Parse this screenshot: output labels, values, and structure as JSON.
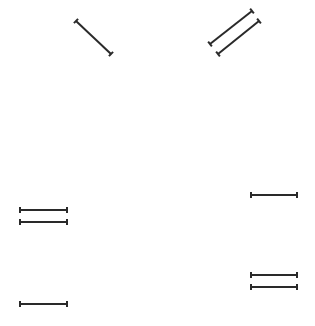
{
  "canvas": {
    "width": 315,
    "height": 326,
    "background": "#ffffff"
  },
  "style": {
    "stroke": "#2a2a2a",
    "stroke_width": 2,
    "cap_length": 6
  },
  "segments": [
    {
      "id": "diag-1",
      "x1": 76,
      "y1": 21,
      "x2": 111,
      "y2": 54
    },
    {
      "id": "diag-2",
      "x1": 210,
      "y1": 44,
      "x2": 252,
      "y2": 11
    },
    {
      "id": "diag-3",
      "x1": 218,
      "y1": 54,
      "x2": 259,
      "y2": 21
    },
    {
      "id": "left-pair-top",
      "x1": 20,
      "y1": 210,
      "x2": 67,
      "y2": 210
    },
    {
      "id": "left-pair-bottom",
      "x1": 20,
      "y1": 222,
      "x2": 67,
      "y2": 222
    },
    {
      "id": "right-single",
      "x1": 251,
      "y1": 195,
      "x2": 297,
      "y2": 195
    },
    {
      "id": "right-pair-top",
      "x1": 251,
      "y1": 275,
      "x2": 297,
      "y2": 275
    },
    {
      "id": "right-pair-bottom",
      "x1": 251,
      "y1": 287,
      "x2": 297,
      "y2": 287
    },
    {
      "id": "bottom-left",
      "x1": 20,
      "y1": 304,
      "x2": 67,
      "y2": 304
    }
  ]
}
